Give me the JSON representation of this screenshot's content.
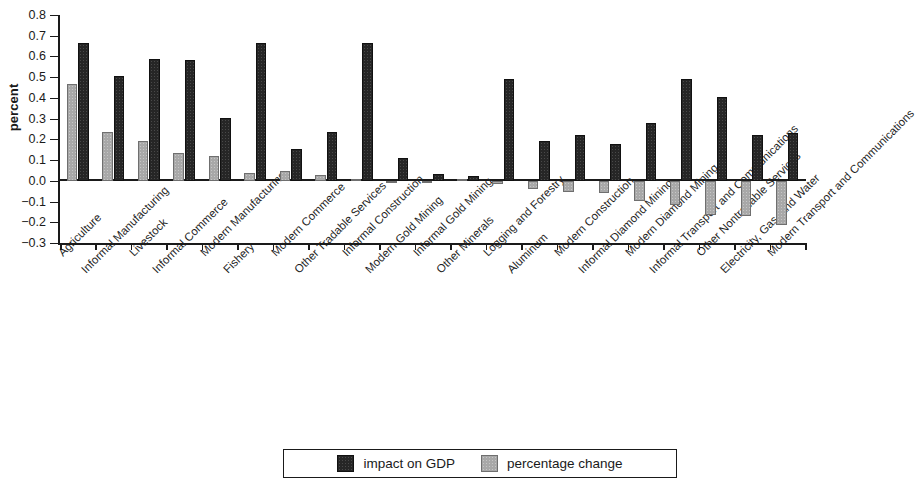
{
  "chart_data": {
    "type": "bar",
    "title": "",
    "xlabel": "",
    "ylabel": "percent",
    "ylim": [
      -0.3,
      0.8
    ],
    "ytick_labels": [
      "0.8",
      "0.7",
      "0.6",
      "0.5",
      "0.4",
      "0.3",
      "0.2",
      "0.1",
      "0.0",
      "−0.1",
      "−0.2",
      "−0.3"
    ],
    "ytick_values": [
      0.8,
      0.7,
      0.6,
      0.5,
      0.4,
      0.3,
      0.2,
      0.1,
      0.0,
      -0.1,
      -0.2,
      -0.3
    ],
    "grid": false,
    "legend_position": "bottom",
    "categories": [
      "Agriculture",
      "Informal Manufacturing",
      "Livestock",
      "Informal Commerce",
      "Modern Manufacturing",
      "Fishery",
      "Modern Commerce",
      "Other Tradable Services",
      "Informal Construction",
      "Modern Gold Mining",
      "Informal Gold Mining",
      "Other Minerals",
      "Logging and Forestry",
      "Aluminum",
      "Modern Construction",
      "Informal Diamond Mining",
      "Modern Diamond Mining",
      "Informal Transport and Communications",
      "Other Nontradable Services",
      "Electricity, Gas, and Water",
      "Modern Transport and Communications"
    ],
    "series": [
      {
        "name": "impact on GDP",
        "color": "#262626",
        "values": [
          0.665,
          0.505,
          0.59,
          0.585,
          0.305,
          0.665,
          0.155,
          0.235,
          0.665,
          0.11,
          0.035,
          0.025,
          0.49,
          0.19,
          0.22,
          0.18,
          0.28,
          0.49,
          0.405,
          0.22,
          0.23
        ]
      },
      {
        "name": "percentage change",
        "color": "#a8a8a8",
        "values": [
          0.465,
          0.235,
          0.19,
          0.135,
          0.12,
          0.04,
          0.045,
          0.03,
          0.01,
          0.0,
          0.0,
          0.01,
          -0.015,
          -0.04,
          -0.055,
          -0.06,
          -0.095,
          -0.115,
          -0.165,
          -0.17,
          -0.215
        ]
      }
    ]
  },
  "legend": {
    "items": [
      {
        "label": "impact on GDP",
        "swatch": "dark"
      },
      {
        "label": "percentage change",
        "swatch": "light"
      }
    ]
  }
}
